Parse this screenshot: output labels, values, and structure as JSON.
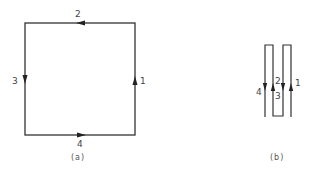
{
  "diagram_a": {
    "caption": "(a)",
    "labels": {
      "right": "1",
      "top": "2",
      "left": "3",
      "bottom": "4"
    },
    "arrows": {
      "right": "up",
      "top": "left",
      "left": "down",
      "bottom": "right"
    },
    "stroke_color": "#333333"
  },
  "diagram_b": {
    "caption": "(b)",
    "labels": {
      "leg1": "1",
      "leg2": "2",
      "leg3": "3",
      "leg4": "4"
    },
    "arrows": {
      "leg1": "up",
      "leg2": "down",
      "leg3": "up",
      "leg4": "down"
    },
    "stroke_color": "#333333"
  }
}
